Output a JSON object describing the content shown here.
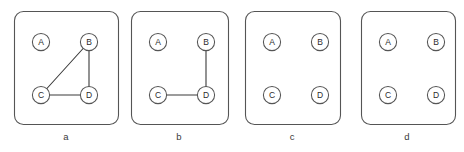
{
  "figure": {
    "title": "",
    "width": 464,
    "height": 152,
    "background_color": "#ffffff",
    "frame_color": "#555555",
    "edge_color": "#3a3a3a",
    "node_fill": "#ffffff",
    "node_stroke": "#555555",
    "label_color": "#2b2b2b",
    "caption_color": "#3a3a3a"
  },
  "chart_data": {
    "type": "diagram",
    "subtype": "graph-node-link",
    "title": "",
    "xlabel": "",
    "ylabel": "",
    "grid": false,
    "legend": null,
    "shared_nodes": [
      {
        "id": "A",
        "label": "A",
        "position": "top-left",
        "x": 27,
        "y": 31
      },
      {
        "id": "B",
        "label": "B",
        "position": "top-right",
        "x": 75,
        "y": 31
      },
      {
        "id": "C",
        "label": "C",
        "position": "bottom-left",
        "x": 27,
        "y": 84
      },
      {
        "id": "D",
        "label": "D",
        "position": "bottom-right",
        "x": 75,
        "y": 84
      }
    ],
    "node_radius": 8.6,
    "panels": [
      {
        "caption": "a",
        "box": {
          "x": 14,
          "y": 11,
          "width": 104,
          "height": 113,
          "radius": 9
        },
        "caption_x": 66,
        "caption_y": 140,
        "edges": [
          {
            "from": "C",
            "to": "B"
          },
          {
            "from": "B",
            "to": "D"
          },
          {
            "from": "C",
            "to": "D"
          }
        ],
        "edge_count": 3,
        "isolated_nodes": [
          "A"
        ]
      },
      {
        "caption": "b",
        "box": {
          "x": 131,
          "y": 11,
          "width": 97,
          "height": 113,
          "radius": 9
        },
        "caption_x": 179,
        "caption_y": 140,
        "edges": [
          {
            "from": "B",
            "to": "D"
          },
          {
            "from": "C",
            "to": "D"
          }
        ],
        "edge_count": 2,
        "isolated_nodes": [
          "A"
        ]
      },
      {
        "caption": "c",
        "box": {
          "x": 245,
          "y": 11,
          "width": 95,
          "height": 113,
          "radius": 9
        },
        "caption_x": 292,
        "caption_y": 140,
        "edges": [],
        "edge_count": 0,
        "isolated_nodes": [
          "A",
          "B",
          "C",
          "D"
        ]
      },
      {
        "caption": "d",
        "box": {
          "x": 361,
          "y": 11,
          "width": 94,
          "height": 113,
          "radius": 9
        },
        "caption_x": 407,
        "caption_y": 140,
        "edges": [],
        "edge_count": 0,
        "isolated_nodes": [
          "A",
          "B",
          "C",
          "D"
        ]
      }
    ]
  }
}
